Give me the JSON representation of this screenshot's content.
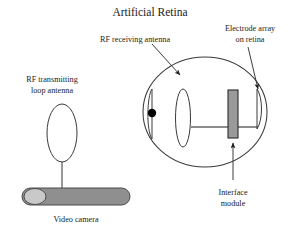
{
  "figure": {
    "title": "Artificial Retina",
    "background_color": "#ffffff",
    "text_color": "#222222"
  },
  "labels": {
    "rf_receiving_antenna": "RF receiving antenna",
    "electrode_array_line1": "Electrode array",
    "electrode_array_line2": "on retina",
    "rf_transmitting_line1": "RF transmitting",
    "rf_transmitting_line2": "loop antenna",
    "interface_module_line1": "Interface",
    "interface_module_line2": "module",
    "video_camera": "Video camera"
  },
  "colors": {
    "outline": "#3a3a3a",
    "module_fill": "#9a9a9a",
    "module_stroke": "#2b2b2b",
    "camera_fill": "#8f8f8f",
    "camera_stroke": "#4a4a4a",
    "lens_fill": "#c9c9c9",
    "lens_stroke": "#4a4a4a",
    "wire": "#8c8c8c",
    "pupil_fill": "#000000",
    "leader": "#333333"
  },
  "parts": {
    "eye": {
      "name": "eye-globe",
      "cx": 205,
      "cy": 112,
      "rx": 62,
      "ry": 55
    },
    "cornea_arc": {
      "name": "cornea-arc"
    },
    "pupil_dot": {
      "name": "pupil-dot",
      "cx": 152,
      "cy": 113,
      "r": 4.2
    },
    "rf_receiving_antenna_coil": {
      "name": "rf-receiving-antenna-coil",
      "cx": 183,
      "cy": 118,
      "rx": 7.5,
      "ry": 29
    },
    "interface_module": {
      "name": "interface-module-block",
      "x": 228,
      "y": 90,
      "width": 10,
      "height": 48
    },
    "electrode_array": {
      "name": "electrode-array-arc"
    },
    "loop_antenna": {
      "name": "rf-transmitting-loop-antenna",
      "cx": 62,
      "cy": 133,
      "rx": 15,
      "ry": 29
    },
    "video_camera_body": {
      "name": "video-camera-body",
      "x": 22,
      "y": 188,
      "width": 108,
      "height": 17
    },
    "video_camera_lens": {
      "name": "video-camera-lens",
      "cx": 35,
      "cy": 196,
      "rx": 11,
      "ry": 8
    }
  }
}
